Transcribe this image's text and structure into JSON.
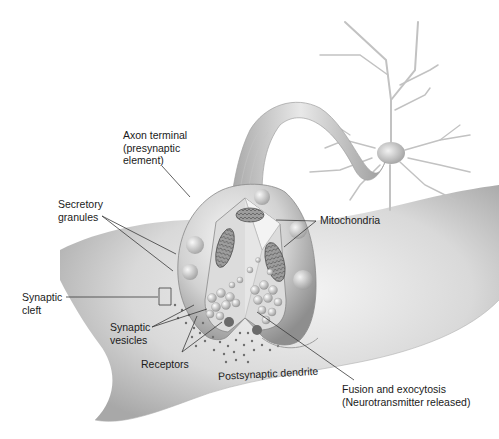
{
  "diagram": {
    "palette": {
      "background": "#ffffff",
      "tissue_light": "#eeeeee",
      "tissue_mid": "#c8c8c8",
      "tissue_dark": "#8c8c8c",
      "label_text": "#1a1a1a",
      "leader_line": "#3a3a3a"
    },
    "labels": {
      "axon_terminal": {
        "lines": [
          "Axon terminal",
          "(presynaptic",
          "element)"
        ]
      },
      "secretory_granules": {
        "lines": [
          "Secretory",
          "granules"
        ]
      },
      "mitochondria": {
        "lines": [
          "Mitochondria"
        ]
      },
      "synaptic_cleft": {
        "lines": [
          "Synaptic",
          "cleft"
        ]
      },
      "synaptic_vesicles": {
        "lines": [
          "Synaptic",
          "vesicles"
        ]
      },
      "receptors": {
        "lines": [
          "Receptors"
        ]
      },
      "postsynaptic_dendrite": {
        "lines": [
          "Postsynaptic dendrite"
        ]
      },
      "fusion_exocytosis": {
        "lines": [
          "Fusion and exocytosis",
          "(Neurotransmitter released)"
        ]
      }
    },
    "structures": [
      "neuron-cell-body",
      "axon",
      "axon-terminal-bouton",
      "cutaway-interior",
      "mitochondria",
      "synaptic-vesicles",
      "secretory-granules",
      "receptor-field",
      "postsynaptic-dendrite"
    ]
  }
}
